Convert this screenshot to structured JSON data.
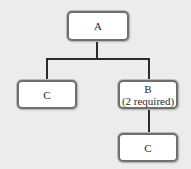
{
  "diagram": {
    "type": "tree",
    "nodes": [
      {
        "id": "A",
        "label": "A",
        "sublabel": null
      },
      {
        "id": "C1",
        "label": "C",
        "sublabel": null
      },
      {
        "id": "B",
        "label": "B",
        "sublabel": "(2 required)"
      },
      {
        "id": "C2",
        "label": "C",
        "sublabel": null
      }
    ],
    "edges": [
      {
        "from": "A",
        "to": "C1"
      },
      {
        "from": "A",
        "to": "B"
      },
      {
        "from": "B",
        "to": "C2"
      }
    ]
  },
  "colors": {
    "background": "#ececec",
    "node_fill": "#ffffff",
    "node_border": "#6f6f6f",
    "connector": "#2b2b2b",
    "text": "#2a2a2a"
  }
}
